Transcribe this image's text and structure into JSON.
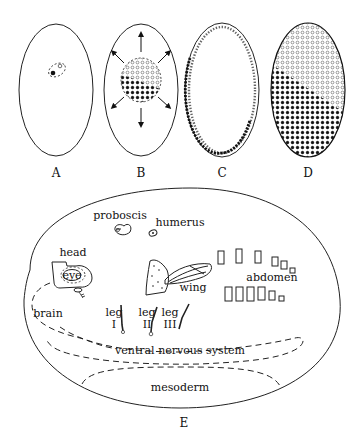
{
  "figure": {
    "panels": [
      {
        "id": "A",
        "label": "A",
        "description": "egg with nucleus (filled) and second nucleus (open) in dashed region"
      },
      {
        "id": "B",
        "label": "B",
        "description": "dividing nuclei cluster (open and filled dots) with outward arrows"
      },
      {
        "id": "C",
        "label": "C",
        "description": "nuclei migrated to periphery; open dots upper, filled dots lower-left"
      },
      {
        "id": "D",
        "label": "D",
        "description": "blastoderm fully covered; open dots upper-right, filled dots lower-left"
      },
      {
        "id": "E",
        "label": "E",
        "description": "fate map of embryo"
      }
    ],
    "fate_map_labels": {
      "proboscis": "proboscis",
      "humerus": "humerus",
      "head": "head",
      "eye": "eye",
      "wing": "wing",
      "abdomen": "abdomen",
      "brain": "brain",
      "leg": "leg",
      "leg_I": "I",
      "leg_II": "II",
      "leg_III": "III",
      "ventral_nervous_system": "ventral nervous system",
      "mesoderm": "mesoderm"
    },
    "colors": {
      "ink": "#222222",
      "open_dot_fill": "#ffffff",
      "filled_dot": "#111111",
      "background": "#ffffff"
    }
  }
}
